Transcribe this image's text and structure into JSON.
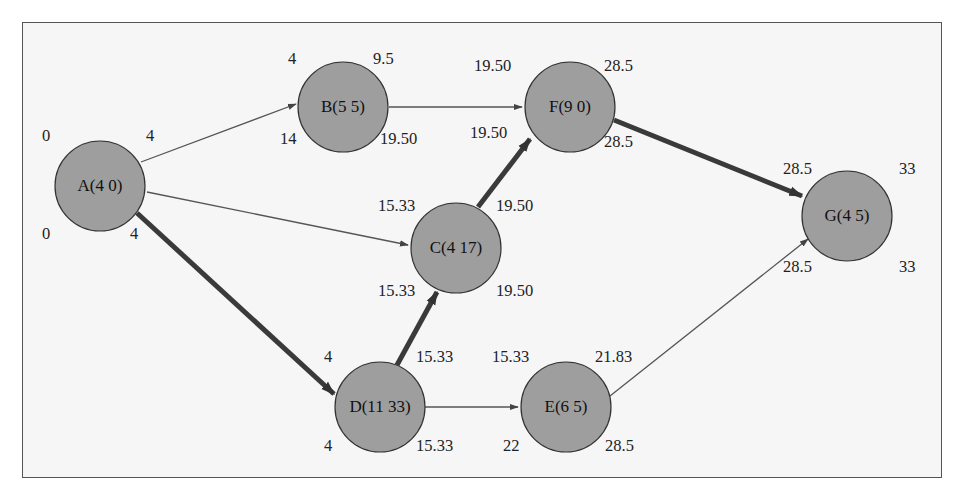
{
  "diagram": {
    "type": "network-critical-path",
    "nodes": [
      {
        "id": "A",
        "label": "A(4 0)",
        "cx": 100,
        "cy": 186,
        "es": "0",
        "ef": "4",
        "ls": "0",
        "lf": "4"
      },
      {
        "id": "B",
        "label": "B(5 5)",
        "cx": 343,
        "cy": 107,
        "es": "4",
        "ef": "9.5",
        "ls": "14",
        "lf": "19.50"
      },
      {
        "id": "F",
        "label": "F(9 0)",
        "cx": 570,
        "cy": 107,
        "es": "19.50",
        "ef": "28.5",
        "ls": "19.50",
        "lf": "28.5"
      },
      {
        "id": "C",
        "label": "C(4 17)",
        "cx": 456,
        "cy": 248,
        "es": "15.33",
        "ef": "19.50",
        "ls": "15.33",
        "lf": "19.50"
      },
      {
        "id": "D",
        "label": "D(11 33)",
        "cx": 380,
        "cy": 407,
        "es": "4",
        "ef": "15.33",
        "ls": "4",
        "lf": "15.33"
      },
      {
        "id": "E",
        "label": "E(6 5)",
        "cx": 566,
        "cy": 407,
        "es": "15.33",
        "ef": "21.83",
        "ls": "22",
        "lf": "28.5"
      },
      {
        "id": "G",
        "label": "G(4 5)",
        "cx": 847,
        "cy": 216,
        "es": "28.5",
        "ef": "33",
        "ls": "28.5",
        "lf": "33"
      }
    ],
    "edges": [
      {
        "from": "A",
        "to": "B",
        "critical": false
      },
      {
        "from": "A",
        "to": "C",
        "critical": false
      },
      {
        "from": "A",
        "to": "D",
        "critical": true
      },
      {
        "from": "B",
        "to": "F",
        "critical": false
      },
      {
        "from": "C",
        "to": "F",
        "critical": true
      },
      {
        "from": "D",
        "to": "C",
        "critical": true
      },
      {
        "from": "D",
        "to": "E",
        "critical": false
      },
      {
        "from": "F",
        "to": "G",
        "critical": true
      },
      {
        "from": "E",
        "to": "G",
        "critical": false
      }
    ],
    "colors": {
      "node_fill": "#9e9e9e",
      "background": "#f6f6f6",
      "critical_edge": "#3a3a3a",
      "edge": "#555555"
    }
  }
}
